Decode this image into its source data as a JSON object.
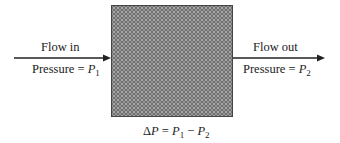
{
  "diagram": {
    "inlet": {
      "label": "Flow in",
      "pressure_prefix": "Pressure = ",
      "pressure_var": "P",
      "pressure_sub": "1"
    },
    "outlet": {
      "label": "Flow out",
      "pressure_prefix": "Pressure = ",
      "pressure_var": "P",
      "pressure_sub": "2"
    },
    "equation": {
      "delta": "Δ",
      "lhs_var": "P",
      "eq": " = ",
      "p1": "P",
      "s1": "1",
      "minus": " − ",
      "p2": "P",
      "s2": "2"
    },
    "colors": {
      "box_fill": "#6f6f6f",
      "line": "#222222"
    }
  }
}
